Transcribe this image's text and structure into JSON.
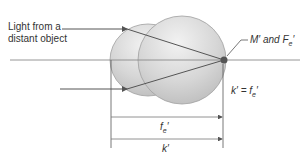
{
  "diagram": {
    "labels": {
      "light_source_line1": "Light from a",
      "light_source_line2": "distant object",
      "focal_point": "M′ and F",
      "focal_point_sub": "e",
      "focal_point_prime": "′",
      "equation_lhs": "k′ = f",
      "equation_sub": "e",
      "equation_prime": "′",
      "dimension_fe": "f",
      "dimension_fe_sub": "e",
      "dimension_fe_prime": "′",
      "dimension_k": "k′"
    },
    "colors": {
      "eye_fill": "#d4d4d4",
      "eye_stroke": "#9a9a9a",
      "ray": "#555555",
      "axis": "#888888",
      "focal_dot": "#555555"
    }
  }
}
